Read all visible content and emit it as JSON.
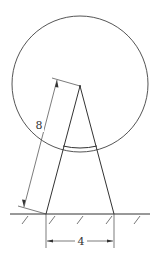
{
  "diagram": {
    "type": "geometry-figure",
    "circle": {
      "cx": 80,
      "cy": 84,
      "r": 68
    },
    "apex": {
      "x": 80,
      "y": 86
    },
    "base_left": {
      "x": 46,
      "y": 214
    },
    "base_right": {
      "x": 114,
      "y": 214
    },
    "ground_y": 214,
    "dimensions": {
      "slant_label": "8",
      "base_label": "4"
    }
  }
}
